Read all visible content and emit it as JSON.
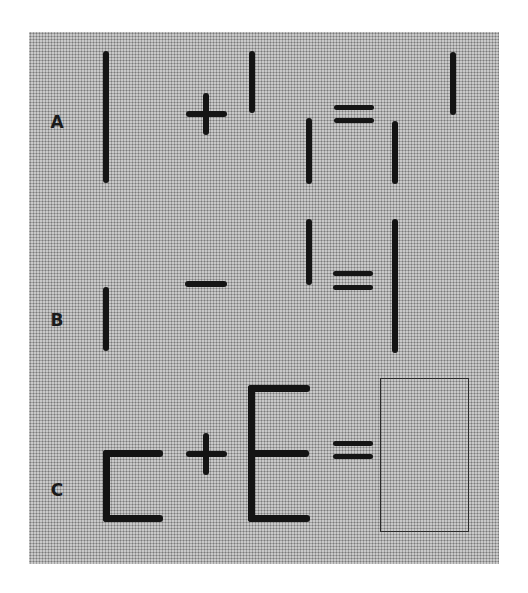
{
  "puzzle": {
    "rows": [
      {
        "label": "A",
        "expression": "| + | = | | |",
        "operator": "+",
        "description": "Long stick plus short stick equals arrangement of three short sticks"
      },
      {
        "label": "B",
        "expression": "| − | = |",
        "operator": "−",
        "description": "Short stick minus raised short stick equals long stick"
      },
      {
        "label": "C",
        "expression": "[ + E = ?",
        "operator": "+",
        "description": "Bracket shape plus E shape equals unknown (empty answer box)"
      }
    ],
    "equals_sign": "=",
    "answer_placeholder": ""
  },
  "colors": {
    "background": "#ffffff",
    "panel_stipple": "#c9c9c9",
    "stroke": "#141414"
  }
}
